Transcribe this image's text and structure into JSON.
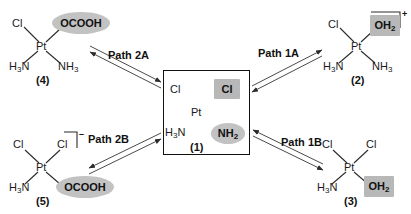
{
  "figure": {
    "type": "reaction-scheme"
  },
  "center": {
    "label": "(1)",
    "ligands": {
      "cl_plain": "Cl",
      "cl_highlight": "Cl",
      "h3n": "H₃N",
      "nh2_highlight": "NH₂"
    },
    "metal": "Pt"
  },
  "structures": [
    {
      "id": "s2",
      "label": "(2)",
      "metal": "Pt",
      "charge": "+",
      "has_bracket": true,
      "ligands": {
        "upper_left": "Cl",
        "upper_right": "OH₂",
        "lower_left": "H₃N",
        "lower_right": "NH₃"
      }
    },
    {
      "id": "s3",
      "label": "(3)",
      "metal": "Pt",
      "charge": "",
      "has_bracket": false,
      "ligands": {
        "upper_left": "Cl",
        "upper_right": "Cl",
        "lower_left": "H₃N",
        "lower_right": "OH₂"
      }
    },
    {
      "id": "s4",
      "label": "(4)",
      "metal": "Pt",
      "charge": "",
      "has_bracket": false,
      "ligands": {
        "upper_left": "Cl",
        "upper_right": "OCOOH",
        "lower_left": "H₃N",
        "lower_right": "NH₃"
      }
    },
    {
      "id": "s5",
      "label": "(5)",
      "metal": "Pt",
      "charge": "–",
      "has_bracket": true,
      "ligands": {
        "upper_left": "Cl",
        "upper_right": "Cl",
        "lower_left": "H₃N",
        "lower_right": "OCOOH"
      }
    }
  ],
  "paths": [
    {
      "id": "p2a",
      "label": "Path 2A"
    },
    {
      "id": "p1a",
      "label": "Path 1A"
    },
    {
      "id": "p2b",
      "label": "Path 2B"
    },
    {
      "id": "p1b",
      "label": "Path 1B"
    }
  ],
  "colors": {
    "highlight_square": "#b8b8b8",
    "highlight_ellipse": "#c2c2c2",
    "line": "#333333",
    "text": "#111111",
    "background": "#ffffff"
  }
}
